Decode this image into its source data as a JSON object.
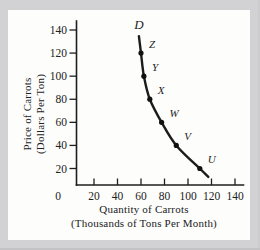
{
  "figure": {
    "background_color": "#d2d2d4",
    "panel_color": "#fdfdfc"
  },
  "chart_data": {
    "type": "line",
    "title": "",
    "xlabel_line1": "Quantity of Carrots",
    "xlabel_line2": "(Thousands of Tons Per Month)",
    "ylabel_line1": "Price of Carrots",
    "ylabel_line2": "(Dollars Per Ton)",
    "curve_label": "D",
    "x_tick_labels": [
      "0",
      "20",
      "40",
      "60",
      "80",
      "100",
      "120",
      "140"
    ],
    "y_tick_labels": [
      "20",
      "40",
      "60",
      "80",
      "100",
      "120",
      "140"
    ],
    "xlim": [
      0,
      140
    ],
    "ylim": [
      0,
      140
    ],
    "grid": false,
    "legend": "none",
    "series": [
      {
        "name": "D",
        "points": [
          {
            "label": "Z",
            "quantity": 60,
            "price": 120
          },
          {
            "label": "Y",
            "quantity": 62.5,
            "price": 100
          },
          {
            "label": "X",
            "quantity": 67.5,
            "price": 80
          },
          {
            "label": "W",
            "quantity": 77.5,
            "price": 60
          },
          {
            "label": "V",
            "quantity": 90,
            "price": 40
          },
          {
            "label": "U",
            "quantity": 110,
            "price": 20
          }
        ]
      }
    ],
    "colors": {
      "curve": "#1c1c1c",
      "axis": "#1e1e1e",
      "text": "#222222"
    }
  }
}
